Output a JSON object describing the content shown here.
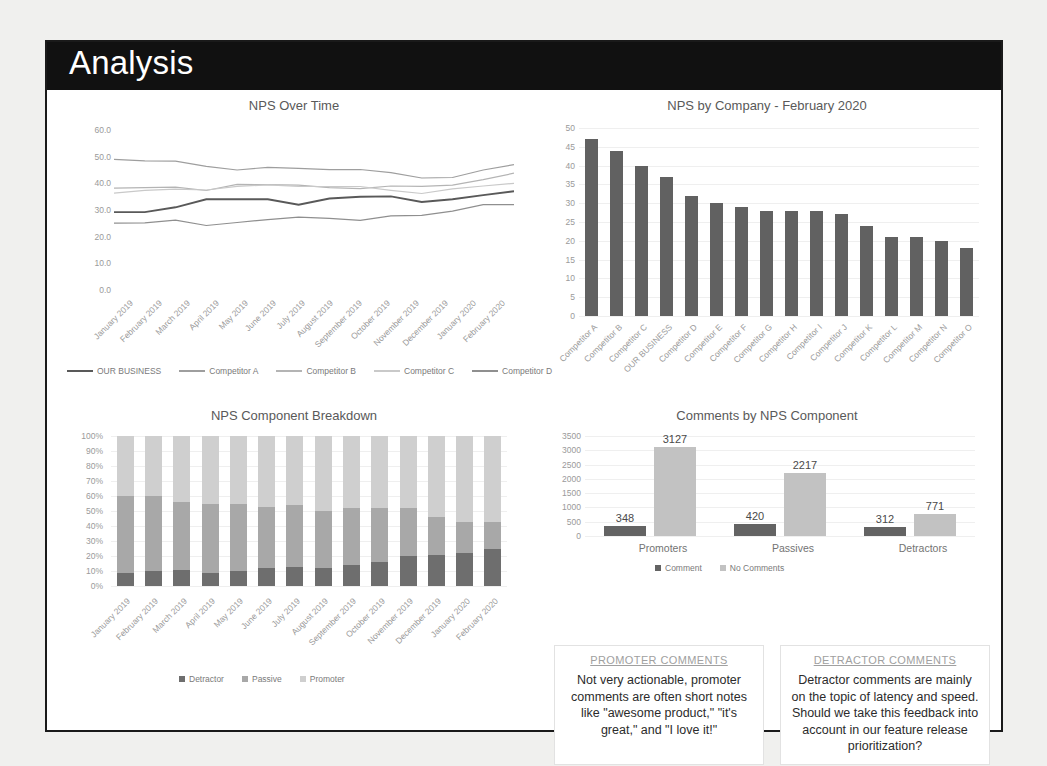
{
  "slide": {
    "title": "Analysis"
  },
  "colors": {
    "header_bg": "#111111",
    "our_business": "#595959",
    "competitor_a": "#9e9e9e",
    "competitor_b": "#b4b4b4",
    "competitor_c": "#c9c9c9",
    "competitor_d": "#8f8f8f",
    "bar_fill": "#616161",
    "detractor": "#6e6e6e",
    "passive": "#a8a8a8",
    "promoter": "#cfcfcf",
    "comment": "#636363",
    "no_comment": "#c2c2c2"
  },
  "chart_data": [
    {
      "id": "nps_over_time",
      "type": "line",
      "title": "NPS Over Time",
      "xlabel": "",
      "ylabel": "",
      "ylim": [
        0,
        60
      ],
      "yticks": [
        "0.0",
        "10.0",
        "20.0",
        "30.0",
        "40.0",
        "50.0",
        "60.0"
      ],
      "grid": false,
      "legend_position": "bottom",
      "categories": [
        "January 2019",
        "February 2019",
        "March 2019",
        "April 2019",
        "May 2019",
        "June 2019",
        "July 2019",
        "August 2019",
        "September 2019",
        "October 2019",
        "November 2019",
        "December 2019",
        "January 2020",
        "February 2020"
      ],
      "series": [
        {
          "name": "OUR BUSINESS",
          "color": "#595959",
          "values": [
            29.2,
            29.2,
            31.0,
            34.0,
            34.0,
            34.0,
            32.0,
            34.3,
            35.0,
            35.1,
            33.0,
            34.0,
            35.6,
            37.0
          ]
        },
        {
          "name": "Competitor A",
          "color": "#9e9e9e",
          "values": [
            49.0,
            48.4,
            48.3,
            46.4,
            45.0,
            46.0,
            45.6,
            45.1,
            45.2,
            44.0,
            42.0,
            42.2,
            45.0,
            47.0
          ]
        },
        {
          "name": "Competitor B",
          "color": "#b4b4b4",
          "values": [
            38.2,
            38.4,
            38.6,
            37.3,
            39.6,
            39.5,
            39.3,
            38.4,
            38.0,
            39.0,
            38.9,
            39.3,
            41.4,
            43.8
          ]
        },
        {
          "name": "Competitor C",
          "color": "#c9c9c9",
          "values": [
            36.3,
            37.4,
            37.8,
            37.5,
            38.9,
            39.4,
            38.9,
            38.8,
            38.8,
            37.4,
            36.2,
            37.9,
            39.0,
            40.0
          ]
        },
        {
          "name": "Competitor D",
          "color": "#8f8f8f",
          "values": [
            25.1,
            25.2,
            26.2,
            24.2,
            25.3,
            26.4,
            27.3,
            26.9,
            26.1,
            27.8,
            28.0,
            29.6,
            32.0,
            32.0
          ]
        }
      ]
    },
    {
      "id": "nps_by_company",
      "type": "bar",
      "title": "NPS by Company - February 2020",
      "xlabel": "",
      "ylabel": "",
      "ylim": [
        0,
        50
      ],
      "yticks": [
        "0",
        "5",
        "10",
        "15",
        "20",
        "25",
        "30",
        "35",
        "40",
        "45",
        "50"
      ],
      "grid": true,
      "categories": [
        "Competitor A",
        "Competitor B",
        "Competitor C",
        "OUR BUSINESS",
        "Competitor D",
        "Competitor E",
        "Competitor F",
        "Competitor G",
        "Competitor H",
        "Competitor I",
        "Competitor J",
        "Competitor K",
        "Competitor L",
        "Competitor M",
        "Competitor N",
        "Competitor O"
      ],
      "values": [
        47,
        44,
        40,
        37,
        32,
        30,
        29,
        28,
        28,
        28,
        27,
        24,
        21,
        21,
        20,
        18
      ]
    },
    {
      "id": "nps_component_breakdown",
      "type": "bar",
      "stacked": true,
      "title": "NPS Component Breakdown",
      "xlabel": "",
      "ylabel": "",
      "ylim": [
        0,
        100
      ],
      "yticks": [
        "0%",
        "10%",
        "20%",
        "30%",
        "40%",
        "50%",
        "60%",
        "70%",
        "80%",
        "90%",
        "100%"
      ],
      "grid": true,
      "legend_position": "bottom",
      "categories": [
        "January 2019",
        "February 2019",
        "March 2019",
        "April 2019",
        "May 2019",
        "June 2019",
        "July 2019",
        "August 2019",
        "September 2019",
        "October 2019",
        "November 2019",
        "December 2019",
        "January 2020",
        "February 2020"
      ],
      "series": [
        {
          "name": "Detractor",
          "color": "#6e6e6e",
          "values": [
            9,
            10,
            11,
            9,
            10,
            12,
            13,
            12,
            14,
            16,
            20,
            21,
            22,
            25
          ]
        },
        {
          "name": "Passive",
          "color": "#a8a8a8",
          "values": [
            51,
            50,
            45,
            46,
            45,
            41,
            41,
            38,
            38,
            36,
            32,
            25,
            21,
            18
          ]
        },
        {
          "name": "Promoter",
          "color": "#cfcfcf",
          "values": [
            40,
            40,
            44,
            45,
            45,
            47,
            46,
            50,
            48,
            48,
            48,
            54,
            57,
            57
          ]
        }
      ]
    },
    {
      "id": "comments_by_nps_component",
      "type": "bar",
      "title": "Comments by NPS Component",
      "xlabel": "",
      "ylabel": "",
      "ylim": [
        0,
        3500
      ],
      "yticks": [
        "0",
        "500",
        "1000",
        "1500",
        "2000",
        "2500",
        "3000",
        "3500"
      ],
      "grid": true,
      "legend_position": "bottom",
      "categories": [
        "Promoters",
        "Passives",
        "Detractors"
      ],
      "series": [
        {
          "name": "Comment",
          "color": "#636363",
          "values": [
            348,
            420,
            312
          ]
        },
        {
          "name": "No Comments",
          "color": "#c2c2c2",
          "values": [
            3127,
            2217,
            771
          ]
        }
      ],
      "data_labels": [
        [
          "348",
          "3127"
        ],
        [
          "420",
          "2217"
        ],
        [
          "312",
          "771"
        ]
      ]
    }
  ],
  "notes": {
    "promoter": {
      "heading": "PROMOTER COMMENTS",
      "body": "Not very actionable, promoter comments are often short notes like \"awesome product,\" \"it's great,\" and \"I love it!\""
    },
    "detractor": {
      "heading": "DETRACTOR COMMENTS",
      "body": "Detractor comments are mainly on the topic of latency and speed. Should we take this feedback into account in our feature release prioritization?"
    }
  }
}
